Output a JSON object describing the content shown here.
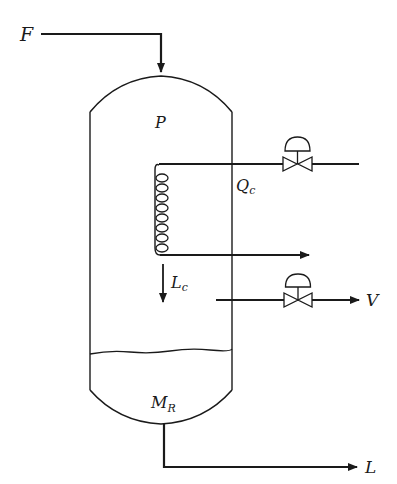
{
  "diagram": {
    "type": "process-flow",
    "colors": {
      "stroke": "#1a1a1a",
      "background": "#ffffff"
    },
    "labels": {
      "feed": "F",
      "pressure": "P",
      "coil_duty_main": "Q",
      "coil_duty_sub": "c",
      "condensate_main": "L",
      "condensate_sub": "c",
      "vapor": "V",
      "holdup_main": "M",
      "holdup_sub": "R",
      "liquid": "L"
    },
    "streams": [
      {
        "name": "feed",
        "label": "F",
        "direction": "into top of vessel"
      },
      {
        "name": "coolant-in",
        "label": "",
        "direction": "into coil via control valve"
      },
      {
        "name": "coolant-out",
        "label": "",
        "direction": "out of coil"
      },
      {
        "name": "vapor",
        "label": "V",
        "direction": "out via control valve"
      },
      {
        "name": "liquid",
        "label": "L",
        "direction": "out of bottom"
      }
    ],
    "valves": [
      {
        "name": "coolant-control-valve",
        "type": "diaphragm control valve"
      },
      {
        "name": "vapor-control-valve",
        "type": "diaphragm control valve"
      }
    ]
  }
}
